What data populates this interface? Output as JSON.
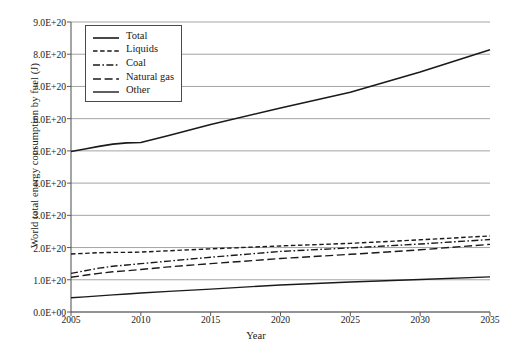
{
  "chart_data": {
    "type": "line",
    "title": "",
    "xlabel": "Year",
    "ylabel": "World total energy consumption by fuel (J)",
    "xlim": [
      2005,
      2035
    ],
    "ylim": [
      0,
      9e+20
    ],
    "grid": true,
    "grid_axis": "y",
    "legend_position": "upper-left-inside",
    "xticks": [
      2005,
      2010,
      2015,
      2020,
      2025,
      2030,
      2035
    ],
    "xtick_labels": [
      "2005",
      "2010",
      "2015",
      "2020",
      "2025",
      "2030",
      "2035"
    ],
    "yticks": [
      0,
      1e+20,
      2e+20,
      3e+20,
      4e+20,
      5e+20,
      6e+20,
      7e+20,
      8e+20,
      9e+20
    ],
    "ytick_labels": [
      "0.0E+00",
      "1.0E+20",
      "2.0E+20",
      "3.0E+20",
      "4.0E+20",
      "5.0E+20",
      "6.0E+20",
      "7.0E+20",
      "8.0E+20",
      "9.0E+20"
    ],
    "x": [
      2005,
      2006,
      2007,
      2008,
      2009,
      2010,
      2012,
      2015,
      2020,
      2025,
      2030,
      2035
    ],
    "series": [
      {
        "name": "Total",
        "style": "solid",
        "color": "#1a1a1a",
        "width": 1.6,
        "values": [
          4.98e+20,
          5.06e+20,
          5.14e+20,
          5.21e+20,
          5.25e+20,
          5.26e+20,
          5.48e+20,
          5.82e+20,
          6.33e+20,
          6.82e+20,
          7.45e+20,
          8.14e+20
        ]
      },
      {
        "name": "Liquids",
        "style": "dashed",
        "color": "#1a1a1a",
        "width": 1.4,
        "values": [
          1.8e+20,
          1.82e+20,
          1.84e+20,
          1.85e+20,
          1.85e+20,
          1.86e+20,
          1.9e+20,
          1.96e+20,
          2.05e+20,
          2.13e+20,
          2.24e+20,
          2.36e+20
        ]
      },
      {
        "name": "Coal",
        "style": "dashdot",
        "color": "#1a1a1a",
        "width": 1.4,
        "values": [
          1.2e+20,
          1.28e+20,
          1.36e+20,
          1.42e+20,
          1.46e+20,
          1.5e+20,
          1.58e+20,
          1.7e+20,
          1.88e+20,
          1.99e+20,
          2.11e+20,
          2.25e+20
        ]
      },
      {
        "name": "Natural gas",
        "style": "longdash",
        "color": "#1a1a1a",
        "width": 1.4,
        "values": [
          1.08e+20,
          1.14e+20,
          1.2e+20,
          1.25e+20,
          1.28e+20,
          1.32e+20,
          1.4e+20,
          1.5e+20,
          1.66e+20,
          1.79e+20,
          1.93e+20,
          2.1e+20
        ]
      },
      {
        "name": "Other",
        "style": "solid",
        "color": "#1a1a1a",
        "width": 1.4,
        "values": [
          4.4e+19,
          4.7e+19,
          5e+19,
          5.3e+19,
          5.6e+19,
          5.9e+19,
          6.4e+19,
          7.1e+19,
          8.4e+19,
          9.3e+19,
          1.01e+20,
          1.09e+20
        ]
      }
    ]
  },
  "legend": {
    "items": [
      {
        "label": "Total"
      },
      {
        "label": "Liquids"
      },
      {
        "label": "Coal"
      },
      {
        "label": "Natural gas"
      },
      {
        "label": "Other"
      }
    ]
  },
  "colors": {
    "line": "#1a1a1a",
    "grid": "#9a9a9a",
    "axis": "#5a5a5a",
    "background": "#ffffff"
  }
}
